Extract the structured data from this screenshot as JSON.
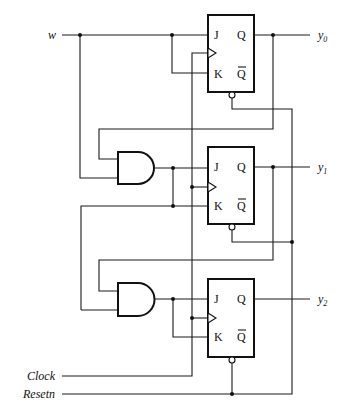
{
  "diagram": {
    "type": "sequential circuit (JK flip-flop counter)",
    "inputs": {
      "w": "w",
      "clock": "Clock",
      "resetn": "Resetn"
    },
    "outputs": [
      {
        "base": "y",
        "sub": "0"
      },
      {
        "base": "y",
        "sub": "1"
      },
      {
        "base": "y",
        "sub": "2"
      }
    ],
    "flip_flops": [
      {
        "J": "J",
        "K": "K",
        "Q": "Q",
        "Qbar": "Q"
      },
      {
        "J": "J",
        "K": "K",
        "Q": "Q",
        "Qbar": "Q"
      },
      {
        "J": "J",
        "K": "K",
        "Q": "Q",
        "Qbar": "Q"
      }
    ],
    "gates": [
      {
        "type": "AND",
        "inputs": [
          "y0",
          "w"
        ],
        "output": "J1,K1"
      },
      {
        "type": "AND",
        "inputs": [
          "y1",
          "J1"
        ],
        "output": "J2,K2"
      }
    ],
    "colors": {
      "line": "#111111",
      "background": "#ffffff"
    }
  }
}
